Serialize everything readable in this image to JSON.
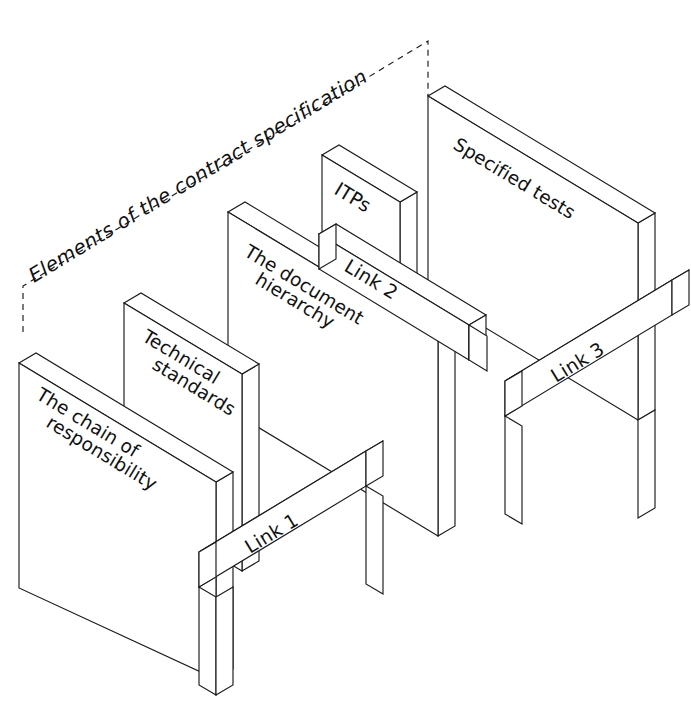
{
  "figure": {
    "title": "Elements of the contract specification",
    "kind": "isometric-block-diagram"
  },
  "panels": [
    {
      "id": "chain-of-responsibility",
      "line1": "The chain of",
      "line2": "responsibility"
    },
    {
      "id": "technical-standards",
      "line1": "Technical",
      "line2": "standards"
    },
    {
      "id": "document-hierarchy",
      "line1": "The document",
      "line2": "hierarchy"
    },
    {
      "id": "itps",
      "line1": "ITPs",
      "line2": ""
    },
    {
      "id": "specified-tests",
      "line1": "Specified tests",
      "line2": ""
    }
  ],
  "links": [
    {
      "id": "link-1",
      "label": "Link 1"
    },
    {
      "id": "link-2",
      "label": "Link 2"
    },
    {
      "id": "link-3",
      "label": "Link 3"
    }
  ],
  "colors": {
    "stroke": "#1a1a1a",
    "fill": "#ffffff",
    "background": "#ffffff",
    "text": "#111111"
  }
}
